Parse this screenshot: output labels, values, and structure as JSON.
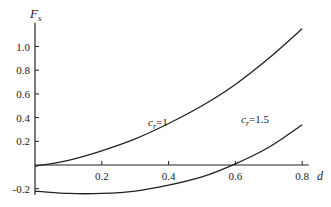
{
  "chart_data": {
    "type": "line",
    "title": "",
    "xlabel": "d",
    "ylabel": "F_s",
    "xlim": [
      0,
      0.82
    ],
    "ylim": [
      -0.25,
      1.2
    ],
    "grid": false,
    "x_ticks": [
      "0.2",
      "0.4",
      "0.6",
      "0.8"
    ],
    "y_ticks": [
      "1.0",
      "0.8",
      "0.6",
      "0.4",
      "0.2",
      "-0.2"
    ],
    "series": [
      {
        "name": "c_r=1",
        "label": "c",
        "sub": "r",
        "eq": "=1",
        "x": [
          0,
          0.1,
          0.2,
          0.3,
          0.4,
          0.5,
          0.6,
          0.7,
          0.8
        ],
        "values": [
          -0.01,
          0.04,
          0.12,
          0.22,
          0.35,
          0.5,
          0.68,
          0.9,
          1.15
        ]
      },
      {
        "name": "c_r=1.5",
        "label": "c",
        "sub": "r",
        "eq": "=1.5",
        "x": [
          0,
          0.1,
          0.2,
          0.3,
          0.4,
          0.5,
          0.6,
          0.7,
          0.8
        ],
        "values": [
          -0.22,
          -0.24,
          -0.24,
          -0.22,
          -0.17,
          -0.1,
          0.01,
          0.15,
          0.34
        ]
      }
    ]
  }
}
